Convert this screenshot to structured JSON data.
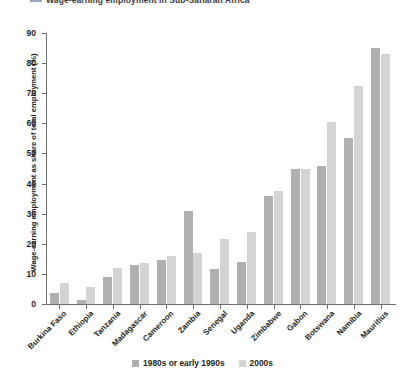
{
  "chart_data": {
    "type": "bar",
    "title": "Wage-earning employment in Sub-Saharan Africa",
    "xlabel": "",
    "ylabel": "Wage-earning employment as share of total employment (%)",
    "ylim": [
      0,
      90
    ],
    "yticks": [
      0,
      10,
      20,
      30,
      40,
      50,
      60,
      70,
      80,
      90
    ],
    "grid": false,
    "legend_position": "bottom",
    "categories": [
      "Burkina Faso",
      "Ethiopia",
      "Tanzania",
      "Madagascar",
      "Cameroon",
      "Zambia",
      "Senegal",
      "Uganda",
      "Zimbabwe",
      "Gabon",
      "Botswana",
      "Namibia",
      "Mauritius"
    ],
    "series": [
      {
        "name": "1980s or early 1990s",
        "color": "#b0b0b0",
        "values": [
          3.5,
          1.2,
          9.0,
          13.0,
          14.5,
          31.0,
          11.5,
          14.0,
          36.0,
          45.0,
          46.0,
          55.0,
          85.0
        ]
      },
      {
        "name": "2000s",
        "color": "#d4d4d4",
        "values": [
          7.0,
          5.5,
          12.0,
          13.5,
          16.0,
          17.0,
          21.5,
          24.0,
          37.5,
          45.0,
          60.5,
          72.5,
          83.0
        ]
      }
    ]
  },
  "legend": {
    "items": [
      {
        "label": "1980s or early 1990s"
      },
      {
        "label": "2000s"
      }
    ]
  }
}
